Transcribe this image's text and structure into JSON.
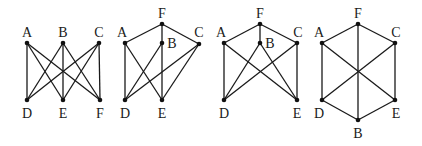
{
  "figure": {
    "graphs": [
      {
        "id": "graph-1",
        "nodes": [
          {
            "label": "A",
            "x": 27,
            "y": 43,
            "lx": 27,
            "ly": 37
          },
          {
            "label": "B",
            "x": 63,
            "y": 43,
            "lx": 63,
            "ly": 37
          },
          {
            "label": "C",
            "x": 99,
            "y": 43,
            "lx": 99,
            "ly": 37
          },
          {
            "label": "D",
            "x": 27,
            "y": 100,
            "lx": 27,
            "ly": 118
          },
          {
            "label": "E",
            "x": 63,
            "y": 100,
            "lx": 63,
            "ly": 118
          },
          {
            "label": "F",
            "x": 100,
            "y": 100,
            "lx": 100,
            "ly": 118
          }
        ],
        "edges": [
          [
            "A",
            "D"
          ],
          [
            "A",
            "E"
          ],
          [
            "A",
            "F"
          ],
          [
            "B",
            "D"
          ],
          [
            "B",
            "E"
          ],
          [
            "B",
            "F"
          ],
          [
            "C",
            "D"
          ],
          [
            "C",
            "E"
          ],
          [
            "C",
            "F"
          ]
        ]
      },
      {
        "id": "graph-2",
        "nodes": [
          {
            "label": "F",
            "x": 162,
            "y": 24,
            "lx": 162,
            "ly": 18
          },
          {
            "label": "A",
            "x": 125,
            "y": 43,
            "lx": 122,
            "ly": 37
          },
          {
            "label": "B",
            "x": 162,
            "y": 43,
            "lx": 172,
            "ly": 48
          },
          {
            "label": "C",
            "x": 199,
            "y": 44,
            "lx": 199,
            "ly": 37
          },
          {
            "label": "D",
            "x": 125,
            "y": 100,
            "lx": 125,
            "ly": 118
          },
          {
            "label": "E",
            "x": 162,
            "y": 100,
            "lx": 162,
            "ly": 118
          }
        ],
        "edges": [
          [
            "F",
            "A"
          ],
          [
            "F",
            "C"
          ],
          [
            "F",
            "B"
          ],
          [
            "B",
            "E"
          ],
          [
            "B",
            "D"
          ],
          [
            "A",
            "D"
          ],
          [
            "A",
            "E"
          ],
          [
            "C",
            "D"
          ],
          [
            "C",
            "E"
          ]
        ]
      },
      {
        "id": "graph-3",
        "nodes": [
          {
            "label": "F",
            "x": 260,
            "y": 24,
            "lx": 260,
            "ly": 18
          },
          {
            "label": "A",
            "x": 224,
            "y": 43,
            "lx": 221,
            "ly": 37
          },
          {
            "label": "B",
            "x": 260,
            "y": 43,
            "lx": 270,
            "ly": 48
          },
          {
            "label": "C",
            "x": 297,
            "y": 43,
            "lx": 298,
            "ly": 37
          },
          {
            "label": "D",
            "x": 224,
            "y": 100,
            "lx": 224,
            "ly": 118
          },
          {
            "label": "E",
            "x": 297,
            "y": 100,
            "lx": 297,
            "ly": 118
          }
        ],
        "edges": [
          [
            "F",
            "A"
          ],
          [
            "F",
            "B"
          ],
          [
            "F",
            "C"
          ],
          [
            "A",
            "D"
          ],
          [
            "A",
            "E"
          ],
          [
            "B",
            "D"
          ],
          [
            "B",
            "E"
          ],
          [
            "C",
            "D"
          ],
          [
            "C",
            "E"
          ]
        ]
      },
      {
        "id": "graph-4",
        "nodes": [
          {
            "label": "F",
            "x": 358,
            "y": 24,
            "lx": 358,
            "ly": 18
          },
          {
            "label": "A",
            "x": 322,
            "y": 43,
            "lx": 319,
            "ly": 37
          },
          {
            "label": "C",
            "x": 395,
            "y": 43,
            "lx": 396,
            "ly": 37
          },
          {
            "label": "D",
            "x": 322,
            "y": 100,
            "lx": 319,
            "ly": 118
          },
          {
            "label": "E",
            "x": 395,
            "y": 100,
            "lx": 396,
            "ly": 118
          },
          {
            "label": "B",
            "x": 358,
            "y": 120,
            "lx": 358,
            "ly": 138
          }
        ],
        "edges": [
          [
            "F",
            "A"
          ],
          [
            "F",
            "C"
          ],
          [
            "C",
            "E"
          ],
          [
            "E",
            "B"
          ],
          [
            "B",
            "D"
          ],
          [
            "D",
            "A"
          ],
          [
            "F",
            "B"
          ],
          [
            "A",
            "E"
          ],
          [
            "C",
            "D"
          ]
        ]
      }
    ]
  }
}
